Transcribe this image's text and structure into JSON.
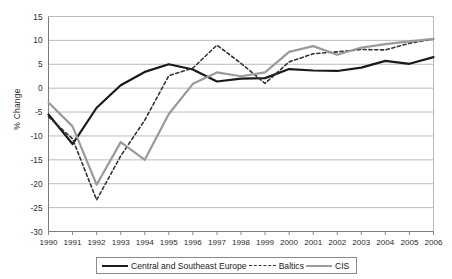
{
  "chart_data": {
    "type": "line",
    "title": "",
    "xlabel": "",
    "ylabel": "% Change",
    "x": [
      1990,
      1991,
      1992,
      1993,
      1994,
      1995,
      1996,
      1997,
      1998,
      1999,
      2000,
      2001,
      2002,
      2003,
      2004,
      2005,
      2006
    ],
    "categories": [
      "1990",
      "1991",
      "1992",
      "1993",
      "1994",
      "1995",
      "1996",
      "1997",
      "1998",
      "1999",
      "2000",
      "2001",
      "2002",
      "2003",
      "2004",
      "2005",
      "2006"
    ],
    "xlim": [
      1990,
      2006
    ],
    "ylim": [
      -30,
      15
    ],
    "yticks": [
      15,
      10,
      5,
      0,
      -5,
      -10,
      -15,
      -20,
      -25,
      -30
    ],
    "ytick_labels": [
      "15",
      "10",
      "5",
      "0",
      "-5",
      "-10",
      "-15",
      "-20",
      "-25",
      "-30"
    ],
    "grid": true,
    "grid_axis": "y",
    "legend_position": "bottom",
    "series": [
      {
        "name": "Central and Southeast Europe",
        "color": "#1a1a1a",
        "style": "solid",
        "width": 2.2,
        "values": [
          -5.5,
          -11.7,
          -4.1,
          0.6,
          3.4,
          5.0,
          3.9,
          1.4,
          2.0,
          2.1,
          4.0,
          3.7,
          3.6,
          4.3,
          5.7,
          5.1,
          6.5
        ]
      },
      {
        "name": "Baltics",
        "color": "#333333",
        "style": "dashed",
        "width": 1.6,
        "values": [
          -6.0,
          -10.6,
          -23.4,
          -14.2,
          -6.7,
          2.6,
          4.2,
          9.0,
          5.2,
          1.0,
          5.5,
          7.2,
          7.6,
          8.1,
          8.0,
          9.4,
          10.3
        ]
      },
      {
        "name": "CIS",
        "color": "#9a9a9a",
        "style": "solid",
        "width": 2.2,
        "values": [
          -3.0,
          -8.0,
          -20.2,
          -11.3,
          -15.0,
          -5.4,
          0.9,
          3.3,
          2.5,
          3.3,
          7.6,
          8.8,
          7.0,
          8.5,
          9.2,
          9.8,
          10.3
        ]
      }
    ]
  },
  "legend": {
    "items": [
      {
        "label": "Central and Southeast Europe",
        "swatch": "solid-dark"
      },
      {
        "label": "Baltics",
        "swatch": "dashed-dark"
      },
      {
        "label": "CIS",
        "swatch": "solid-gray"
      }
    ]
  },
  "axis": {
    "y_title": "% Change"
  }
}
